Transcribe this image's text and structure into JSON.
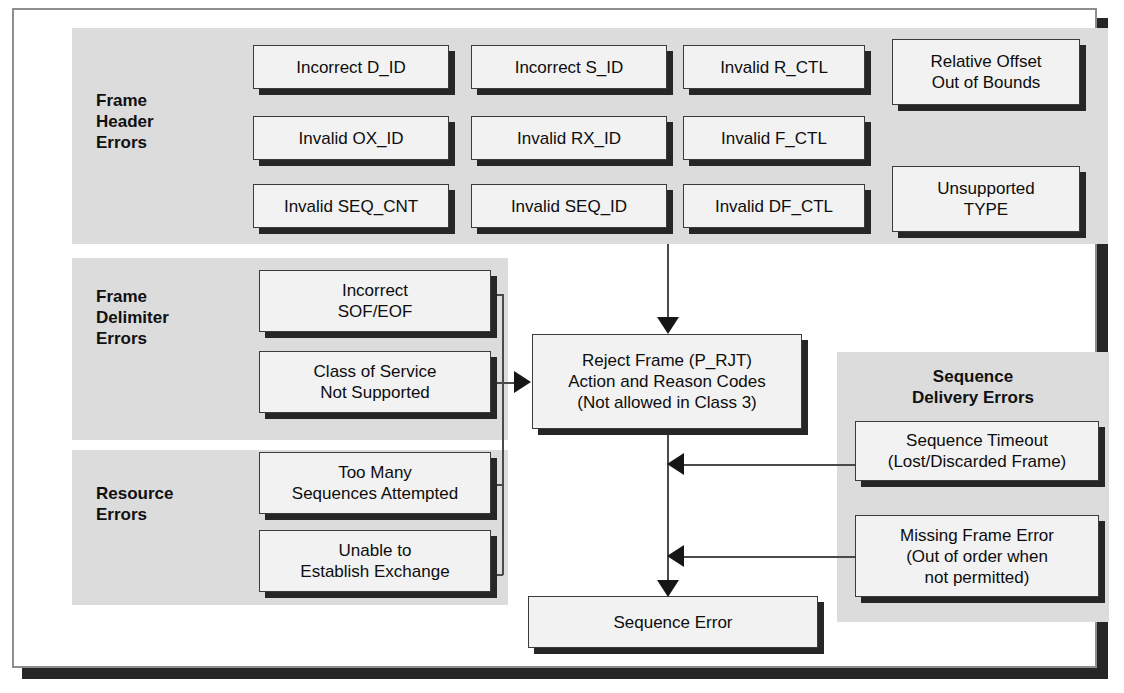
{
  "diagram": {
    "colors": {
      "panel_gray": "#dcdcdc",
      "node_fill": "#f2f2f2",
      "node_border": "#3b3b3b",
      "shadow": "#262626",
      "connector": "#4a4a4a",
      "frame_border": "#8e8e8e"
    },
    "groups": [
      {
        "id": "frame-header-errors",
        "title": "Frame\nHeader\nErrors",
        "nodes": [
          "Incorrect D_ID",
          "Incorrect S_ID",
          "Invalid R_CTL",
          "Relative Offset\nOut of Bounds",
          "Invalid OX_ID",
          "Invalid RX_ID",
          "Invalid F_CTL",
          "Invalid SEQ_CNT",
          "Invalid SEQ_ID",
          "Invalid DF_CTL",
          "Unsupported\nTYPE"
        ]
      },
      {
        "id": "frame-delimiter-errors",
        "title": "Frame\nDelimiter\nErrors",
        "nodes": [
          "Incorrect\nSOF/EOF",
          "Class of Service\nNot Supported"
        ]
      },
      {
        "id": "resource-errors",
        "title": "Resource\nErrors",
        "nodes": [
          "Too Many\nSequences Attempted",
          "Unable to\nEstablish Exchange"
        ]
      },
      {
        "id": "sequence-delivery-errors",
        "title": "Sequence\nDelivery Errors",
        "nodes": [
          "Sequence Timeout\n(Lost/Discarded Frame)",
          "Missing Frame Error\n(Out of order when\nnot permitted)"
        ]
      }
    ],
    "header_nodes": {
      "incorrect_d_id": "Incorrect D_ID",
      "incorrect_s_id": "Incorrect S_ID",
      "invalid_r_ctl": "Invalid R_CTL",
      "relative_offset": "Relative Offset\nOut of Bounds",
      "invalid_ox_id": "Invalid OX_ID",
      "invalid_rx_id": "Invalid RX_ID",
      "invalid_f_ctl": "Invalid F_CTL",
      "invalid_seq_cnt": "Invalid SEQ_CNT",
      "invalid_seq_id": "Invalid SEQ_ID",
      "invalid_df_ctl": "Invalid DF_CTL",
      "unsupported_type": "Unsupported\nTYPE"
    },
    "delimiter_nodes": {
      "incorrect_sof_eof": "Incorrect\nSOF/EOF",
      "class_of_service": "Class of Service\nNot Supported"
    },
    "resource_nodes": {
      "too_many_sequences": "Too Many\nSequences Attempted",
      "unable_to_establish": "Unable to\nEstablish Exchange"
    },
    "delivery_nodes": {
      "sequence_timeout": "Sequence Timeout\n(Lost/Discarded Frame)",
      "missing_frame_error": "Missing Frame Error\n(Out of order when\nnot permitted)"
    },
    "group_titles": {
      "frame_header": "Frame\nHeader\nErrors",
      "frame_delimiter": "Frame\nDelimiter\nErrors",
      "resource": "Resource\nErrors",
      "sequence_delivery": "Sequence\nDelivery Errors"
    },
    "outcome_nodes": {
      "reject_frame": "Reject Frame (P_RJT)\nAction and Reason Codes\n(Not allowed in Class 3)",
      "sequence_error": "Sequence Error"
    }
  }
}
